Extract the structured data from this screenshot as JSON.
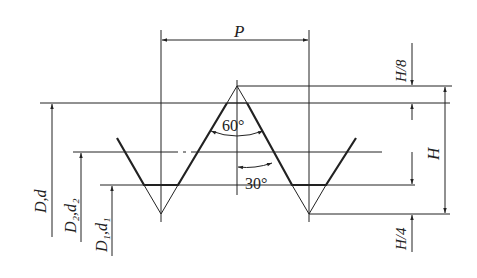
{
  "diagram": {
    "labels": {
      "pitch": "P",
      "flank_angle": "60°",
      "half_angle": "30°",
      "crest_truncation": "H/8",
      "root_truncation": "H/4",
      "height": "H",
      "major_diameter": "D,d",
      "pitch_diameter": "D₂,d₂",
      "minor_diameter": "D₁,d₁"
    },
    "colors": {
      "line": "#222222",
      "background": "#ffffff"
    }
  }
}
